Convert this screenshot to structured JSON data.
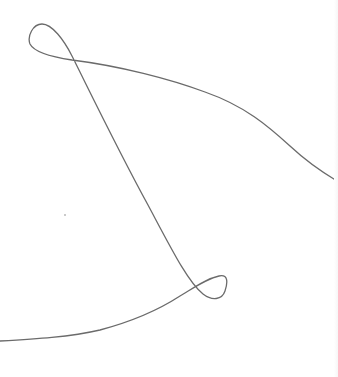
{
  "canvas": {
    "label": "Freehand sketch canvas",
    "width": 338,
    "height": 377,
    "background": "#ffffff"
  },
  "stroke": {
    "color": "#6b6b6b",
    "width": 1.3,
    "description": "Single continuous freehand curve with two self-intersecting loops",
    "path": "M 337 181 C 322 172, 305 160, 290 146 C 268 126, 245 106, 205 92 C 170 79, 120 66, 72 60 C 52 57, 34 52, 30 44 C 27 36, 33 24, 42 24 C 52 24, 64 40, 72 56 C 92 96, 118 150, 148 205 C 172 250, 188 282, 203 294 C 212 301, 222 300, 225 291 C 228 282, 228 274, 219 276 C 206 279, 195 287, 180 296 C 160 309, 130 322, 100 330 C 70 337, 35 339, 0 341"
  },
  "annotations": {
    "top_loop": {
      "cx": 40,
      "cy": 40
    },
    "top_crossing": {
      "x": 72,
      "y": 58
    },
    "bottom_loop": {
      "cx": 216,
      "cy": 287
    },
    "bottom_crossing": {
      "x": 200,
      "y": 287
    }
  }
}
